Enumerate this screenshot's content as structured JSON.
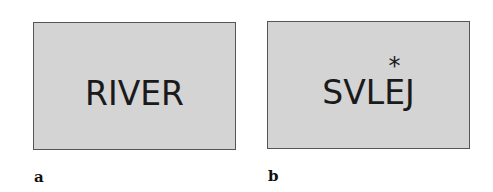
{
  "panels": [
    {
      "label": "a",
      "word": "RIVER",
      "background": "#d4d4d4",
      "border": "#555555"
    },
    {
      "label": "b",
      "word_letters": [
        "S",
        "V",
        "L",
        "E",
        "J"
      ],
      "marked_letter_index": 3,
      "marker": "*",
      "background": "#d4d4d4",
      "border": "#555555"
    }
  ]
}
